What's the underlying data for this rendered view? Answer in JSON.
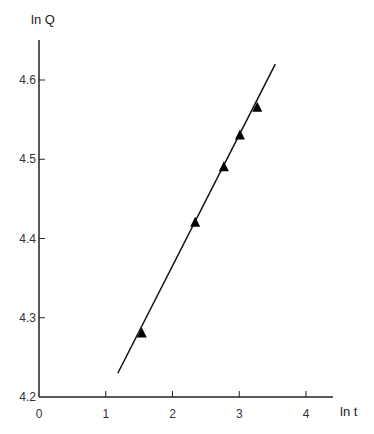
{
  "chart_data": {
    "type": "scatter",
    "title": "",
    "xlabel": "ln t",
    "ylabel": "ln Q",
    "xlim": [
      0,
      4.4
    ],
    "ylim": [
      4.2,
      4.66
    ],
    "x_ticks": [
      "0",
      "1",
      "2",
      "3",
      "4"
    ],
    "y_ticks": [
      "4.2",
      "4.3",
      "4.4",
      "4.5",
      "4.6"
    ],
    "grid": false,
    "legend": null,
    "series": [
      {
        "name": "data",
        "marker": "filled-triangle",
        "points": [
          {
            "x": 1.54,
            "y": 4.28
          },
          {
            "x": 2.34,
            "y": 4.42
          },
          {
            "x": 2.77,
            "y": 4.49
          },
          {
            "x": 3.01,
            "y": 4.53
          },
          {
            "x": 3.27,
            "y": 4.565
          }
        ]
      },
      {
        "name": "fit",
        "type": "line",
        "points": [
          {
            "x": 1.18,
            "y": 4.23
          },
          {
            "x": 3.54,
            "y": 4.62
          }
        ]
      }
    ]
  },
  "labels": {
    "y_axis_title": "ln Q",
    "x_axis_title": "ln t"
  }
}
